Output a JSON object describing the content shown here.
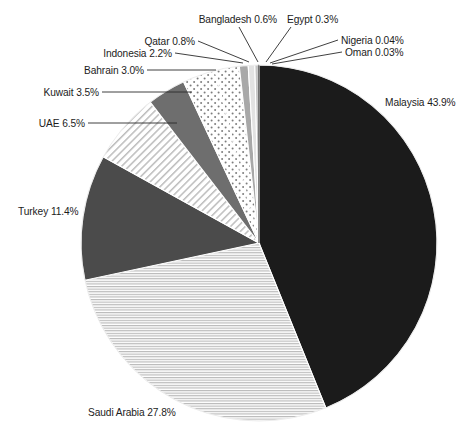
{
  "chart_data": {
    "type": "pie",
    "title": "",
    "subtitle": "",
    "xlabel": "",
    "ylabel": "",
    "legend_position": "none",
    "labels_outside": true,
    "categories": [
      "Malaysia",
      "Saudi Arabia",
      "Turkey",
      "UAE",
      "Kuwait",
      "Bahrain",
      "Indonesia",
      "Qatar",
      "Bangladesh",
      "Egypt",
      "Nigeria",
      "Oman"
    ],
    "values": [
      43.9,
      27.8,
      11.4,
      6.5,
      3.5,
      3.0,
      2.2,
      0.8,
      0.6,
      0.3,
      0.04,
      0.03
    ],
    "unit": "%",
    "start_angle_deg": 0,
    "direction": "clockwise",
    "slices": [
      {
        "name": "Malaysia",
        "value": 43.9,
        "label": "Malaysia 43.9%",
        "fill": "#1b1b1b",
        "pattern": "solid"
      },
      {
        "name": "Saudi Arabia",
        "value": 27.8,
        "label": "Saudi Arabia 27.8%",
        "fill": "#ffffff",
        "pattern": "horizontal-lines"
      },
      {
        "name": "Turkey",
        "value": 11.4,
        "label": "Turkey 11.4%",
        "fill": "#4b4b4b",
        "pattern": "solid"
      },
      {
        "name": "UAE",
        "value": 6.5,
        "label": "UAE 6.5%",
        "fill": "#ffffff",
        "pattern": "diagonal-lines"
      },
      {
        "name": "Kuwait",
        "value": 3.5,
        "label": "Kuwait 3.5%",
        "fill": "#6e6e6e",
        "pattern": "solid"
      },
      {
        "name": "Bahrain",
        "value": 3.0,
        "label": "Bahrain 3.0%",
        "fill": "#ffffff",
        "pattern": "dots"
      },
      {
        "name": "Indonesia",
        "value": 2.2,
        "label": "Indonesia 2.2%",
        "fill": "#ffffff",
        "pattern": "dots"
      },
      {
        "name": "Qatar",
        "value": 0.8,
        "label": "Qatar 0.8%",
        "fill": "#a8a8a8",
        "pattern": "solid"
      },
      {
        "name": "Bangladesh",
        "value": 0.6,
        "label": "Bangladesh 0.6%",
        "fill": "#e2e2e2",
        "pattern": "solid"
      },
      {
        "name": "Egypt",
        "value": 0.3,
        "label": "Egypt 0.3%",
        "fill": "#c4c4c4",
        "pattern": "solid"
      },
      {
        "name": "Nigeria",
        "value": 0.04,
        "label": "Nigeria 0.04%",
        "fill": "#8e8e8e",
        "pattern": "solid"
      },
      {
        "name": "Oman",
        "value": 0.03,
        "label": "Oman 0.03%",
        "fill": "#6a6a6a",
        "pattern": "solid"
      }
    ]
  },
  "labels": {
    "malaysia": "Malaysia 43.9%",
    "saudi_arabia": "Saudi Arabia 27.8%",
    "turkey": "Turkey 11.4%",
    "uae": "UAE 6.5%",
    "kuwait": "Kuwait 3.5%",
    "bahrain": "Bahrain 3.0%",
    "indonesia": "Indonesia 2.2%",
    "qatar": "Qatar 0.8%",
    "bangladesh": "Bangladesh 0.6%",
    "egypt": "Egypt 0.3%",
    "nigeria": "Nigeria 0.04%",
    "oman": "Oman 0.03%"
  },
  "colors": {
    "malaysia": "#1b1b1b",
    "turkey": "#4b4b4b",
    "kuwait": "#6e6e6e",
    "qatar": "#a8a8a8",
    "bangladesh": "#e2e2e2",
    "text": "#1c1c1c",
    "background": "#ffffff"
  }
}
